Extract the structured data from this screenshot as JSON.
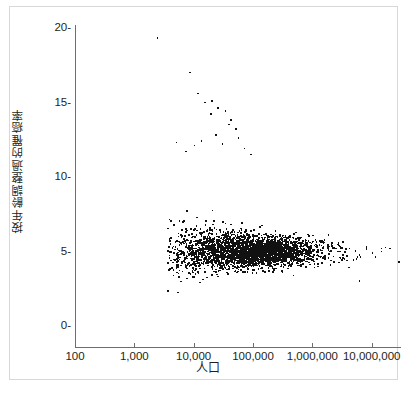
{
  "chart": {
    "type": "scatter",
    "xlabel": "人口",
    "ylabel": "按年齡調整過的罹癌率",
    "title": "",
    "point_color": "#111111",
    "axis_color": "#6d6d6d",
    "frame_color": "#d8d8d8",
    "x_scale": "log",
    "y_scale": "linear",
    "xlim": [
      100,
      30000000
    ],
    "ylim": [
      0,
      20
    ],
    "grid": false,
    "legend": null,
    "x_ticks": [
      {
        "value": 100,
        "label": "100"
      },
      {
        "value": 1000,
        "label": "1,000"
      },
      {
        "value": 10000,
        "label": "10,000"
      },
      {
        "value": 100000,
        "label": "100,000"
      },
      {
        "value": 1000000,
        "label": "1,000,000"
      },
      {
        "value": 10000000,
        "label": "10,000,000"
      }
    ],
    "y_ticks": [
      {
        "value": 0,
        "label": "0-"
      },
      {
        "value": 5,
        "label": "5-"
      },
      {
        "value": 10,
        "label": "10-"
      },
      {
        "value": 15,
        "label": "15-"
      },
      {
        "value": 20,
        "label": "20-"
      }
    ],
    "n_points": 3000,
    "mean_rate": 5.0,
    "funnel_k": 42,
    "x_center_log": 4.9,
    "x_spread_log": 0.62,
    "seed": 20240607
  }
}
